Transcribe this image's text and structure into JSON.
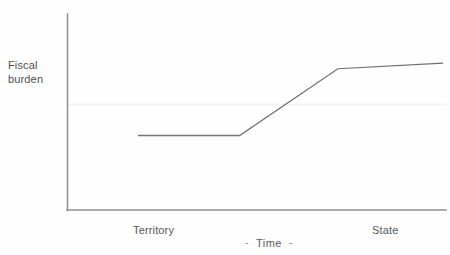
{
  "chart_data": {
    "type": "line",
    "title": "",
    "subtitle": "",
    "xlabel": "Time",
    "ylabel": "Fiscal burden",
    "xlabel_prefix_dash": "-",
    "xlabel_suffix_dash": "-",
    "grid": false,
    "legend": null,
    "axis_color": "#8c8c8c",
    "line_color": "#6e6e6e",
    "text_color": "#575757",
    "background": "#ffffff",
    "xlim": [
      0,
      100
    ],
    "ylim": [
      0,
      100
    ],
    "x_tick_labels": [
      "Territory",
      "State"
    ],
    "x_tick_positions": [
      24,
      85
    ],
    "y_tick_labels": [],
    "annotations": [],
    "series": [
      {
        "name": "Fiscal burden over time",
        "style": "solid-thin",
        "x": [
          10,
          40,
          69,
          100
        ],
        "y": [
          32,
          32,
          79,
          83
        ],
        "points": [
          {
            "x": 10,
            "y": 32,
            "note": "start of flat territory phase"
          },
          {
            "x": 40,
            "y": 32,
            "note": "end of flat territory phase"
          },
          {
            "x": 69,
            "y": 79,
            "note": "end of steep transition rise"
          },
          {
            "x": 100,
            "y": 83,
            "note": "end of gentle statehood rise"
          }
        ]
      }
    ]
  },
  "figure": {
    "y_axis_label_line1": "Fiscal",
    "y_axis_label_line2": "burden",
    "x_tick_left": "Territory",
    "x_tick_right": "State",
    "x_axis_title": "Time",
    "dash_left": "-",
    "dash_right": "-"
  }
}
